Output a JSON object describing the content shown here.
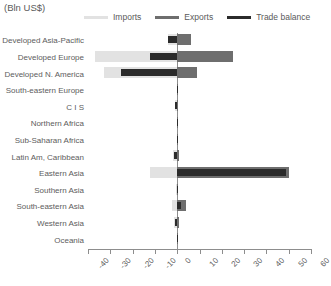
{
  "chart_data": {
    "type": "bar",
    "orientation": "horizontal",
    "title": "(Bln US$)",
    "xlabel": "",
    "ylabel": "",
    "xlim": [
      -40,
      60
    ],
    "xticks": [
      -40,
      -30,
      -20,
      -10,
      0,
      10,
      20,
      30,
      40,
      50,
      60
    ],
    "grid": false,
    "legend_position": "top",
    "categories": [
      "Developed Asia-Pacific",
      "Developed Europe",
      "Developed N. America",
      "South-eastern Europe",
      "C I S",
      "Northern Africa",
      "Sub-Saharan Africa",
      "Latin Am, Caribbean",
      "Eastern Asia",
      "Southern Asia",
      "South-eastern Asia",
      "Western Asia",
      "Oceania"
    ],
    "series": [
      {
        "name": "Imports",
        "color": "#e2e2e2",
        "values": [
          -4.0,
          -37.0,
          -33.0,
          -0.3,
          -1.2,
          -0.3,
          -0.2,
          -2.0,
          -12.0,
          -0.4,
          -2.5,
          -1.5,
          -0.2
        ]
      },
      {
        "name": "Exports",
        "color": "#6e6e6e",
        "values": [
          6.0,
          25.0,
          9.0,
          0.2,
          0.4,
          0.2,
          0.1,
          0.8,
          50.0,
          0.3,
          4.0,
          1.0,
          0.1
        ]
      },
      {
        "name": "Trade balance",
        "color": "#2b2b2b",
        "values": [
          -4.0,
          -12.0,
          -25.0,
          -0.2,
          -1.0,
          -0.2,
          -0.2,
          -1.5,
          49.0,
          -0.3,
          1.5,
          -1.2,
          -0.2
        ]
      }
    ]
  },
  "legend": {
    "items": [
      {
        "label": "Imports",
        "color": "#e2e2e2"
      },
      {
        "label": "Exports",
        "color": "#6e6e6e"
      },
      {
        "label": "Trade balance",
        "color": "#2b2b2b"
      }
    ]
  },
  "axis": {
    "tick_labels": [
      "-40",
      "-30",
      "-20",
      "-10",
      "0",
      "10",
      "20",
      "30",
      "40",
      "50",
      "60"
    ]
  }
}
